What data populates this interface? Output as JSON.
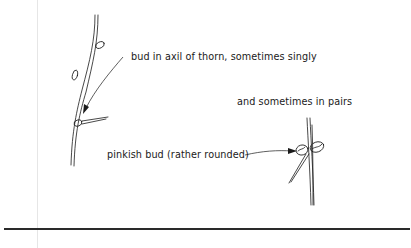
{
  "figure": {
    "annotations": [
      {
        "id": "single",
        "text": "bud in axil of thorn, sometimes singly"
      },
      {
        "id": "pairs",
        "text": "and sometimes in pairs"
      },
      {
        "id": "pinkish",
        "text": "pinkish bud (rather rounded)"
      }
    ],
    "stroke_color": "#1a1a1a",
    "rule_color": "#2a2a2a",
    "margin_line_color": "#e6e6e6"
  }
}
